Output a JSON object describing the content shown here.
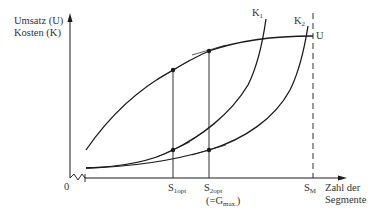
{
  "diagram": {
    "y_axis_label_line1": "Umsatz (U)",
    "y_axis_label_line2": "Kosten (K)",
    "x_axis_label_line1": "Zahl der",
    "x_axis_label_line2": "Segmente",
    "origin_label": "0",
    "curves": {
      "revenue": "U",
      "cost1_main": "K",
      "cost1_sub": "1",
      "cost2_main": "K",
      "cost2_sub": "2"
    },
    "x_markers": {
      "s1_main": "S",
      "s1_sub": "1opt",
      "s2_main": "S",
      "s2_sub": "2opt",
      "s2_note_prefix": "(=G",
      "s2_note_sub": "max.",
      "s2_note_suffix": ")",
      "sm_main": "S",
      "sm_sub": "M"
    },
    "colors": {
      "line": "#1a1a1a",
      "text": "#333333",
      "background": "#ffffff"
    }
  }
}
